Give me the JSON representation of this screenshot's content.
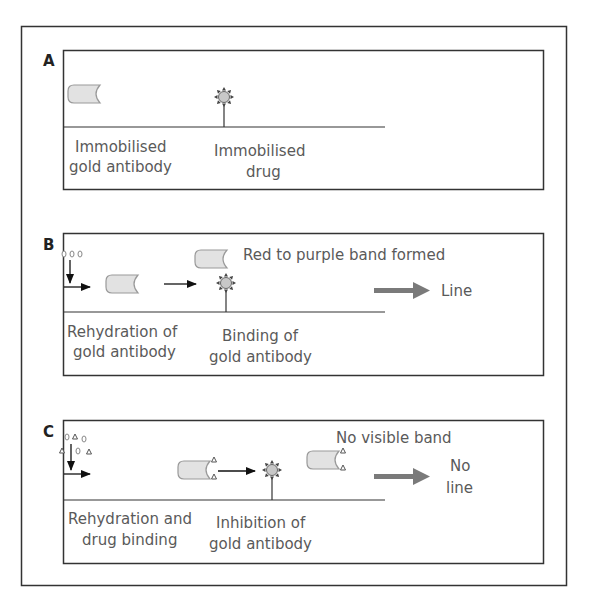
{
  "colors": {
    "frame": "#333333",
    "text": "#5a5a5a",
    "antibody_fill": "#e2e2e2",
    "antibody_stroke": "#999999",
    "drug_fill": "#c8c8c8",
    "drug_spike": "#444444",
    "big_arrow": "#7a7a7a",
    "arrow": "#111111"
  },
  "panels": [
    {
      "letter": "A",
      "labels": {
        "left_line1": "Immobilised",
        "left_line2": "gold antibody",
        "mid_line1": "Immobilised",
        "mid_line2": "drug"
      }
    },
    {
      "letter": "B",
      "labels": {
        "top": "Red to purple band formed",
        "result": "Line",
        "left_line1": "Rehydration of",
        "left_line2": "gold antibody",
        "mid_line1": "Binding of",
        "mid_line2": "gold antibody"
      }
    },
    {
      "letter": "C",
      "labels": {
        "top": "No visible band",
        "result_line1": "No",
        "result_line2": "line",
        "left_line1": "Rehydration and",
        "left_line2": "drug binding",
        "mid_line1": "Inhibition of",
        "mid_line2": "gold antibody"
      }
    }
  ]
}
